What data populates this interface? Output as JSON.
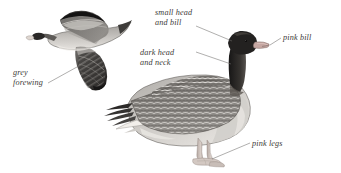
{
  "plate": {
    "title": "Pink-footed Goose identification plate",
    "background_color": "#ffffff",
    "label_color": "#3c3a38",
    "leader_color": "#6e6c6a"
  },
  "labels": [
    {
      "id": "small-head",
      "text": "small head\nand bill",
      "target": "crown of standing goose"
    },
    {
      "id": "dark-head",
      "text": "dark head\nand neck",
      "target": "neck of standing goose"
    },
    {
      "id": "pink-bill",
      "text": "pink bill",
      "target": "bill of standing goose"
    },
    {
      "id": "pink-legs",
      "text": "pink legs",
      "target": "legs of standing goose"
    },
    {
      "id": "grey-forewing",
      "text": "grey\nforewing",
      "target": "forewing of flying goose"
    }
  ],
  "figures": [
    {
      "id": "flying-goose",
      "pose": "in flight, left-facing",
      "colors": {
        "wing_dark": "#2e2c2b",
        "wing_pale": "#b9b6b2",
        "body": "#7d7a77",
        "bill": "#d8cfc9"
      }
    },
    {
      "id": "standing-goose",
      "pose": "standing, right-facing",
      "colors": {
        "head_neck": "#262423",
        "bill": "#c9a9a4",
        "breast": "#c3c0bc",
        "wing": "#6d6a67",
        "legs": "#cfc3bd"
      }
    }
  ]
}
